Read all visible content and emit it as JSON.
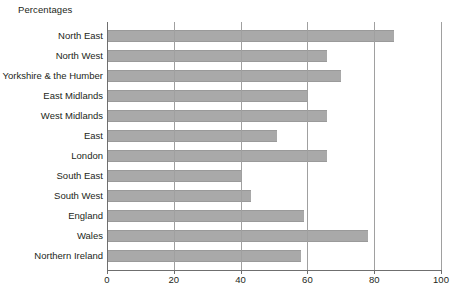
{
  "chart_data": {
    "type": "bar",
    "orientation": "horizontal",
    "title": "Percentages",
    "xlabel": "",
    "ylabel": "",
    "xlim": [
      0,
      100
    ],
    "xticks": [
      0,
      20,
      40,
      60,
      80,
      100
    ],
    "grid": "vertical",
    "legend": "none",
    "bar_color": "#a9a9a9",
    "categories": [
      "North East",
      "North West",
      "Yorkshire & the Humber",
      "East Midlands",
      "West Midlands",
      "East",
      "London",
      "South East",
      "South West",
      "England",
      "Wales",
      "Northern Ireland"
    ],
    "values": [
      86,
      66,
      70,
      60,
      66,
      51,
      66,
      40,
      43,
      59,
      78,
      58
    ]
  }
}
